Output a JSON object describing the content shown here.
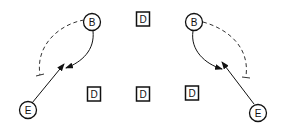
{
  "diagram": {
    "nodes": [
      {
        "id": "B1",
        "label": "B",
        "shape": "circle",
        "x": 92,
        "y": 22
      },
      {
        "id": "E1",
        "label": "E",
        "shape": "circle",
        "x": 28,
        "y": 110
      },
      {
        "id": "B2",
        "label": "B",
        "shape": "circle",
        "x": 194,
        "y": 22
      },
      {
        "id": "E2",
        "label": "E",
        "shape": "circle",
        "x": 258,
        "y": 113
      },
      {
        "id": "D1",
        "label": "D",
        "shape": "square",
        "x": 143,
        "y": 19
      },
      {
        "id": "D2",
        "label": "D",
        "shape": "square",
        "x": 94,
        "y": 94
      },
      {
        "id": "D3",
        "label": "D",
        "shape": "square",
        "x": 143,
        "y": 94
      },
      {
        "id": "D4",
        "label": "D",
        "shape": "square",
        "x": 192,
        "y": 93
      }
    ],
    "colors": {
      "stroke": "#111111",
      "background": "#ffffff"
    }
  }
}
